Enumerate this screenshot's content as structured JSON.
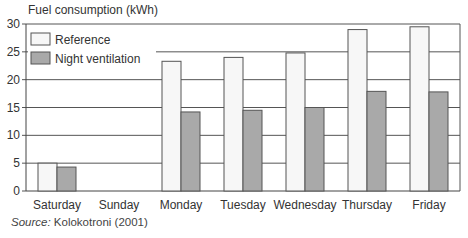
{
  "chart_data": {
    "type": "bar",
    "title": "",
    "ylabel": "Fuel consumption (kWh)",
    "xlabel": "",
    "categories": [
      "Saturday",
      "Sunday",
      "Monday",
      "Tuesday",
      "Wednesday",
      "Thursday",
      "Friday"
    ],
    "series": [
      {
        "name": "Reference",
        "color": "#f7f7f7",
        "values": [
          5.0,
          0,
          23.3,
          24.0,
          24.8,
          29.0,
          29.5
        ]
      },
      {
        "name": "Night ventilation",
        "color": "#a9a9a9",
        "values": [
          4.3,
          0,
          14.2,
          14.5,
          15.0,
          17.9,
          17.8
        ]
      }
    ],
    "ylim": [
      0,
      30
    ],
    "yticks": [
      0,
      5,
      10,
      15,
      20,
      25,
      30
    ],
    "grid": true,
    "legend_position": "upper-left",
    "source_label": "Source:",
    "source_text": "Kolokotroni (2001)"
  }
}
